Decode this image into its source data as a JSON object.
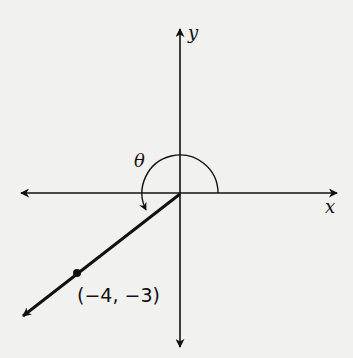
{
  "diagram": {
    "axes": {
      "x_label": "x",
      "y_label": "y"
    },
    "angle_label": "θ",
    "point": {
      "x": -4,
      "y": -3,
      "label": "(−4, −3)"
    },
    "terminal_side_quadrant": "III",
    "colors": {
      "ink": "#111111",
      "background": "#f1f1ef"
    }
  }
}
